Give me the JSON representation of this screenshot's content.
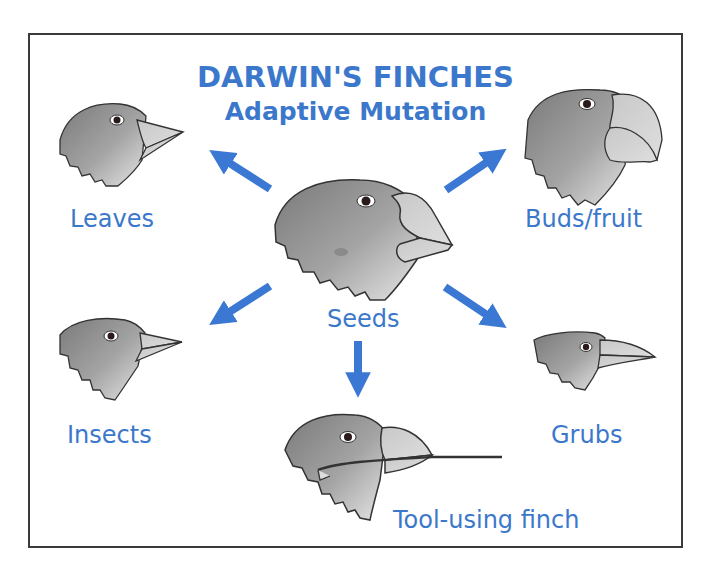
{
  "title": {
    "main": "DARWIN'S FINCHES",
    "subtitle": "Adaptive Mutation"
  },
  "colors": {
    "accent": "#3b78cc",
    "arrow": "#3a78d4",
    "border": "#3a3a3a",
    "background": "#ffffff"
  },
  "center": {
    "label": "Seeds",
    "icon": "finch-head-large-beak"
  },
  "branches": [
    {
      "label": "Leaves",
      "icon": "finch-head-conical-beak",
      "direction": "up-left"
    },
    {
      "label": "Buds/fruit",
      "icon": "finch-head-parrot-beak",
      "direction": "up-right"
    },
    {
      "label": "Insects",
      "icon": "finch-head-pointed-beak",
      "direction": "down-left"
    },
    {
      "label": "Grubs",
      "icon": "finch-head-long-curved-beak",
      "direction": "down-right"
    },
    {
      "label": "Tool-using finch",
      "icon": "finch-head-holding-twig",
      "direction": "down"
    }
  ]
}
